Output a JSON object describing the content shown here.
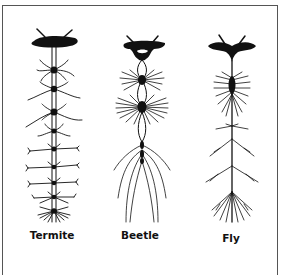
{
  "figure": {
    "panels": [
      {
        "id": "termite",
        "label": "Termite"
      },
      {
        "id": "beetle",
        "label": "Beetle"
      },
      {
        "id": "fly",
        "label": "Fly"
      }
    ]
  }
}
